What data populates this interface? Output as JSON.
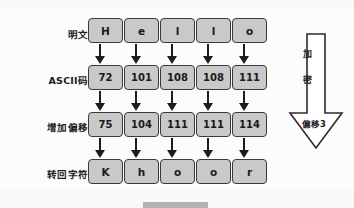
{
  "diagram": {
    "rows": [
      {
        "label": "明文:",
        "kind": "chr",
        "cells": [
          "H",
          "e",
          "l",
          "l",
          "o"
        ]
      },
      {
        "label": "ASCII码:",
        "kind": "num",
        "cells": [
          "72",
          "101",
          "108",
          "108",
          "111"
        ]
      },
      {
        "label": "增加偏移:",
        "kind": "num",
        "cells": [
          "75",
          "104",
          "111",
          "111",
          "114"
        ]
      },
      {
        "label": "转回字符:",
        "kind": "chr",
        "cells": [
          "K",
          "h",
          "o",
          "o",
          "r"
        ]
      }
    ],
    "side_arrow": {
      "char_1": "加",
      "char_2": "密",
      "shift_label": "偏移3"
    },
    "colors": {
      "cell_fill": "#c9c9c9",
      "cell_border": "#3a3a3a",
      "text": "#1a1a1a",
      "arrow": "#1c1c1c",
      "background": "#fcfcfc"
    }
  }
}
